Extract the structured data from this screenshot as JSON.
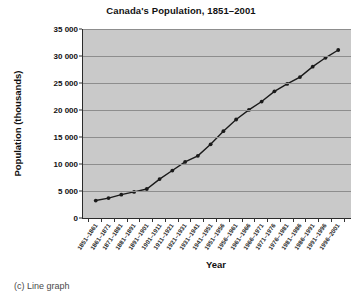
{
  "caption": "(c) Line graph",
  "chart_data": {
    "type": "line",
    "title": "Canada's Population, 1851–2001",
    "xlabel": "Year",
    "ylabel": "Population (thousands)",
    "ylim": [
      0,
      35000
    ],
    "ytick_labels": [
      "0",
      "5 000",
      "10 000",
      "15 000",
      "20 000",
      "25 000",
      "30 000",
      "35 000"
    ],
    "ytick_values": [
      0,
      5000,
      10000,
      15000,
      20000,
      25000,
      30000,
      35000
    ],
    "grid": true,
    "legend": "none",
    "marker": "filled-circle",
    "line_color": "#1a1a1a",
    "plot_background": "#c9c9c9",
    "categories": [
      "1851–1861",
      "1861–1871",
      "1871–1881",
      "1881–1891",
      "1891–1901",
      "1901–1911",
      "1911–1921",
      "1921–1931",
      "1931–1941",
      "1941–1951",
      "1951–1956",
      "1956–1961",
      "1961–1966",
      "1966–1971",
      "1971–1976",
      "1976–1981",
      "1981–1986",
      "1986–1991",
      "1991–1996",
      "1996–2001"
    ],
    "values": [
      3230,
      3690,
      4325,
      4833,
      5371,
      7207,
      8788,
      10377,
      11507,
      13648,
      16081,
      18238,
      20015,
      21568,
      23450,
      24820,
      26100,
      28030,
      29670,
      31110
    ]
  }
}
